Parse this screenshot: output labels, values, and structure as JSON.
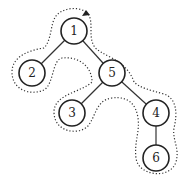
{
  "diagram": {
    "type": "binary-tree-euler-tour",
    "nodes": [
      {
        "id": "1",
        "label": "1",
        "x": 74,
        "y": 31
      },
      {
        "id": "2",
        "label": "2",
        "x": 32,
        "y": 73
      },
      {
        "id": "5",
        "label": "5",
        "x": 112,
        "y": 73
      },
      {
        "id": "3",
        "label": "3",
        "x": 72,
        "y": 113
      },
      {
        "id": "4",
        "label": "4",
        "x": 156,
        "y": 113
      },
      {
        "id": "6",
        "label": "6",
        "x": 156,
        "y": 158
      }
    ],
    "edges": [
      {
        "from": "1",
        "to": "2"
      },
      {
        "from": "1",
        "to": "5"
      },
      {
        "from": "5",
        "to": "3"
      },
      {
        "from": "5",
        "to": "4"
      },
      {
        "from": "4",
        "to": "6"
      }
    ],
    "contour": {
      "style": "dotted",
      "arrow_at": "top"
    }
  }
}
